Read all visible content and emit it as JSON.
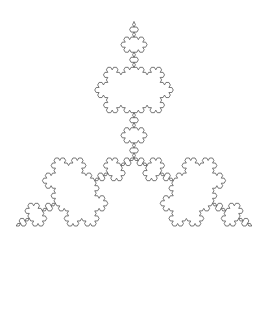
{
  "figure": {
    "kind": "koch-snowflake",
    "canvas": {
      "width": 267,
      "height": 309,
      "background_color": "#ffffff"
    },
    "stroke": {
      "color": "#555555",
      "width": 0.8,
      "fill": "none",
      "linejoin": "round",
      "linecap": "round"
    },
    "geometry": {
      "iterations": 4,
      "initiator": "equilateral-triangle",
      "generator": "koch-curve",
      "orientation_degrees": -90,
      "center_x": 134,
      "center_y": 158,
      "circumradius": 136,
      "bounds": {
        "min_x": 15,
        "min_y": 18,
        "max_x": 252,
        "max_y": 294
      },
      "symmetry_order": 6,
      "point_count": 768,
      "smallest_feature_px": 2.9
    },
    "landmarks": {
      "top_point": [
        134,
        18
      ],
      "bottom_point": [
        134,
        294
      ],
      "left_extent": [
        15,
        158
      ],
      "right_extent": [
        252,
        158
      ]
    }
  }
}
